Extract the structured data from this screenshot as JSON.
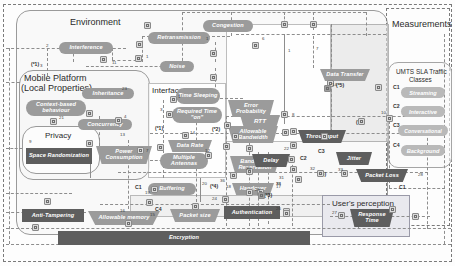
{
  "diagram": {
    "zones": {
      "environment": "Environment",
      "mobile_platform_line1": "Mobile Platform",
      "mobile_platform_line2": "(Local Properties)",
      "interface": "Interface",
      "measurements": "Measurements",
      "umts_line1": "UMTS SLA Traffic",
      "umts_line2": "Classes",
      "privacy": "Privacy",
      "user_perception": "User's perception"
    },
    "nodes": {
      "interference": "Interference",
      "retransmission": "Retransmission",
      "congestion": "Congestion",
      "noise": "Noise",
      "inheritance": "Inheritance",
      "context_based": "Context-based behaviour",
      "concurrency": "Concurrency",
      "time_sleeping": "Time Sleeping",
      "required_time_on": "Required Time \"on\"",
      "data_rate": "Data Rate",
      "multiple_antennas": "Multiple Antennas",
      "space_randomization": "Space Randomization",
      "power_consumption": "Power Consumption",
      "buffering": "Buffering",
      "anti_tampering": "Anti-Tampering",
      "allowable_memory": "Allowable memory",
      "packet_size": "Packet size",
      "encryption": "Encryption",
      "bandwidth_reservation": "Bandwidth Reservation",
      "handover": "Handover",
      "authentication": "Authentication",
      "error_probability": "Error Probability",
      "allowable_bandwidth": "Allowable Bandwidth",
      "data_transfer": "Data Transfer",
      "rtt": "RTT",
      "throughput": "Throughput",
      "delay": "Delay",
      "jitter": "Jitter",
      "packet_loss": "Packet Loss",
      "response_time": "Response Time"
    },
    "traffic_classes": [
      {
        "code": "C1",
        "label": "Streaming"
      },
      {
        "code": "C2",
        "label": "Interactive"
      },
      {
        "code": "C3",
        "label": "Conversational"
      },
      {
        "code": "C4",
        "label": "Background"
      }
    ],
    "class_badges": {
      "b_buffering": "C1",
      "b_packet_size": "C4",
      "b_multiple_antennas": "C2",
      "b_jitter": "C3",
      "b_packet_loss": "C1"
    },
    "footnotes": {
      "f1": "(*1)",
      "f1b": "(*1)",
      "f2": "(*2)",
      "f2b": "(*2)",
      "f3": "(*3)",
      "f4": "(*4)",
      "f5": "(*5)",
      "f6": "(*6)"
    },
    "edge_numbers": {
      "e1": "2",
      "e2": "3",
      "e3": "11",
      "e4": "5",
      "e5": "1",
      "e6": "9",
      "e7": "23",
      "e8": "21",
      "e9": "4",
      "e10": "6",
      "e11": "12",
      "e12": "13",
      "e13": "7",
      "e14": "8",
      "e15": "10",
      "e16": "14",
      "e17": "15",
      "e18": "16",
      "e19": "17",
      "e20": "18",
      "e21": "19",
      "e22": "20",
      "e23": "22",
      "e24": "24",
      "e25": "25",
      "e26": "26",
      "e27": "27",
      "e28": "28",
      "e29": "29",
      "e30": "30",
      "e31": "31",
      "e32": "32",
      "e33": "33",
      "e34": "34",
      "e35": "35",
      "e36": "36"
    },
    "colors": {
      "node_mid": "#9b9b9b",
      "node_dark": "#5e5e5e",
      "node_light": "#c2c2c2",
      "border_dash": "#8d8d8d",
      "zone_border": "#9a9a9a"
    }
  }
}
